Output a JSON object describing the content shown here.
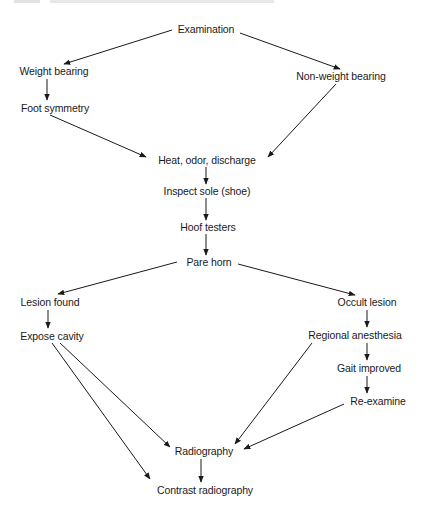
{
  "diagram": {
    "type": "flowchart",
    "header_clipped": true,
    "nodes": [
      {
        "id": "examination",
        "label": "Examination",
        "x": 206,
        "y": 29
      },
      {
        "id": "weight_bearing",
        "label": "Weight bearing",
        "x": 54,
        "y": 71
      },
      {
        "id": "non_weight_bearing",
        "label": "Non-weight bearing",
        "x": 341,
        "y": 76
      },
      {
        "id": "foot_symmetry",
        "label": "Foot symmetry",
        "x": 55,
        "y": 108
      },
      {
        "id": "heat_odor_discharge",
        "label": "Heat, odor, discharge",
        "x": 207,
        "y": 160
      },
      {
        "id": "inspect_sole",
        "label": "Inspect sole (shoe)",
        "x": 207,
        "y": 191
      },
      {
        "id": "hoof_testers",
        "label": "Hoof testers",
        "x": 208,
        "y": 227
      },
      {
        "id": "pare_horn",
        "label": "Pare horn",
        "x": 209,
        "y": 262
      },
      {
        "id": "lesion_found",
        "label": "Lesion found",
        "x": 50,
        "y": 302
      },
      {
        "id": "occult_lesion",
        "label": "Occult lesion",
        "x": 367,
        "y": 302
      },
      {
        "id": "expose_cavity",
        "label": "Expose cavity",
        "x": 52,
        "y": 336
      },
      {
        "id": "regional_anesthesia",
        "label": "Regional anesthesia",
        "x": 355,
        "y": 335
      },
      {
        "id": "gait_improved",
        "label": "Gait improved",
        "x": 369,
        "y": 368
      },
      {
        "id": "re_examine",
        "label": "Re-examine",
        "x": 378,
        "y": 401
      },
      {
        "id": "radiography",
        "label": "Radiography",
        "x": 204,
        "y": 451
      },
      {
        "id": "contrast_radiography",
        "label": "Contrast radiography",
        "x": 205,
        "y": 490
      }
    ],
    "edges": [
      {
        "from": "examination",
        "to": "weight_bearing",
        "x1": 172,
        "y1": 30,
        "x2": 64,
        "y2": 64
      },
      {
        "from": "examination",
        "to": "non_weight_bearing",
        "x1": 240,
        "y1": 33,
        "x2": 340,
        "y2": 69
      },
      {
        "from": "weight_bearing",
        "to": "foot_symmetry",
        "x1": 47,
        "y1": 79,
        "x2": 47,
        "y2": 100
      },
      {
        "from": "foot_symmetry",
        "to": "heat_odor_discharge",
        "x1": 50,
        "y1": 115,
        "x2": 146,
        "y2": 157
      },
      {
        "from": "non_weight_bearing",
        "to": "heat_odor_discharge",
        "x1": 336,
        "y1": 84,
        "x2": 268,
        "y2": 157
      },
      {
        "from": "heat_odor_discharge",
        "to": "inspect_sole",
        "x1": 206,
        "y1": 167,
        "x2": 206,
        "y2": 184
      },
      {
        "from": "inspect_sole",
        "to": "hoof_testers",
        "x1": 206,
        "y1": 198,
        "x2": 206,
        "y2": 220
      },
      {
        "from": "hoof_testers",
        "to": "pare_horn",
        "x1": 206,
        "y1": 234,
        "x2": 206,
        "y2": 255
      },
      {
        "from": "pare_horn",
        "to": "lesion_found",
        "x1": 177,
        "y1": 262,
        "x2": 58,
        "y2": 294
      },
      {
        "from": "pare_horn",
        "to": "occult_lesion",
        "x1": 238,
        "y1": 264,
        "x2": 355,
        "y2": 295
      },
      {
        "from": "lesion_found",
        "to": "expose_cavity",
        "x1": 48,
        "y1": 310,
        "x2": 48,
        "y2": 328
      },
      {
        "from": "occult_lesion",
        "to": "regional_anesthesia",
        "x1": 367,
        "y1": 310,
        "x2": 367,
        "y2": 327
      },
      {
        "from": "regional_anesthesia",
        "to": "gait_improved",
        "x1": 367,
        "y1": 343,
        "x2": 367,
        "y2": 360
      },
      {
        "from": "gait_improved",
        "to": "re_examine",
        "x1": 367,
        "y1": 376,
        "x2": 367,
        "y2": 393
      },
      {
        "from": "expose_cavity",
        "to": "radiography",
        "x1": 60,
        "y1": 343,
        "x2": 170,
        "y2": 447
      },
      {
        "from": "expose_cavity",
        "to": "contrast_radiography",
        "x1": 52,
        "y1": 343,
        "x2": 150,
        "y2": 479
      },
      {
        "from": "regional_anesthesia",
        "to": "radiography",
        "x1": 312,
        "y1": 343,
        "x2": 235,
        "y2": 444
      },
      {
        "from": "re_examine",
        "to": "radiography",
        "x1": 344,
        "y1": 404,
        "x2": 244,
        "y2": 449
      },
      {
        "from": "radiography",
        "to": "contrast_radiography",
        "x1": 201,
        "y1": 459,
        "x2": 201,
        "y2": 482
      }
    ]
  }
}
